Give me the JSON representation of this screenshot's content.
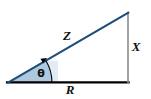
{
  "figure": {
    "width": 151,
    "height": 99,
    "background": "#ffffff"
  },
  "labels": {
    "hypotenuse": "Z",
    "vertical": "X",
    "base": "R",
    "angle": "θ"
  },
  "label_positions": {
    "hypotenuse": {
      "x": 67,
      "y": 35
    },
    "vertical": {
      "x": 136,
      "y": 46
    },
    "base": {
      "x": 70,
      "y": 89
    },
    "angle": {
      "x": 41,
      "y": 73
    }
  },
  "geometry": {
    "origin": {
      "x": 8,
      "y": 83
    },
    "base_end": {
      "x": 128,
      "y": 83
    },
    "apex": {
      "x": 128,
      "y": 13
    },
    "arc_radius": 44,
    "arrow_tip": {
      "x": 47,
      "y": 58
    }
  },
  "colors": {
    "hypotenuse": "#1f4e79",
    "vertical_side": "#8c8c8c",
    "base_side": "#000000",
    "fill": "#9dbcd8",
    "fill_opacity": "0.75",
    "arc": "#000000",
    "label_text": "#111111"
  },
  "stroke_widths": {
    "hypotenuse": 2.2,
    "vertical_side": 1.6,
    "base_side": 2.2,
    "arc": 1.1
  }
}
